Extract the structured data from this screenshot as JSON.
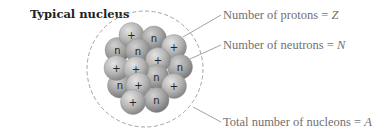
{
  "title": "Typical nucleus",
  "labels": {
    "protons": {
      "text": "Number of protons = ",
      "var": "Z"
    },
    "neutrons": {
      "text": "Number of neutrons = ",
      "var": "N"
    },
    "nucleons": {
      "text": "Total number of nucleons = ",
      "var": "A"
    }
  },
  "symbols": {
    "proton": "+",
    "neutron": "n"
  },
  "colors": {
    "ball_light": "#e4e4e4",
    "ball_mid": "#b4b4b4",
    "ball_dark": "#7c7c7c",
    "neutron_light": "#d2d2d2",
    "neutron_mid": "#a2a2a2",
    "neutron_dark": "#6e6e6e"
  },
  "boundary": {
    "cx": 145,
    "cy": 69,
    "r": 58
  },
  "nucleons": [
    {
      "type": "neutron",
      "x": 120,
      "y": 85.5
    },
    {
      "type": "neutron",
      "x": 117.5,
      "y": 50
    },
    {
      "type": "proton",
      "x": 131.5,
      "y": 35
    },
    {
      "type": "neutron",
      "x": 154,
      "y": 38.5
    },
    {
      "type": "neutron",
      "x": 138,
      "y": 51
    },
    {
      "type": "proton",
      "x": 116.5,
      "y": 68
    },
    {
      "type": "proton",
      "x": 174,
      "y": 47
    },
    {
      "type": "neutron",
      "x": 180,
      "y": 67
    },
    {
      "type": "proton",
      "x": 158,
      "y": 60
    },
    {
      "type": "neutron",
      "x": 156.5,
      "y": 77
    },
    {
      "type": "proton",
      "x": 174,
      "y": 86
    },
    {
      "type": "proton",
      "x": 136,
      "y": 69
    },
    {
      "type": "proton",
      "x": 138.5,
      "y": 85
    },
    {
      "type": "neutron",
      "x": 156.5,
      "y": 100
    },
    {
      "type": "proton",
      "x": 133,
      "y": 102
    }
  ],
  "ball_radius": 12.5
}
